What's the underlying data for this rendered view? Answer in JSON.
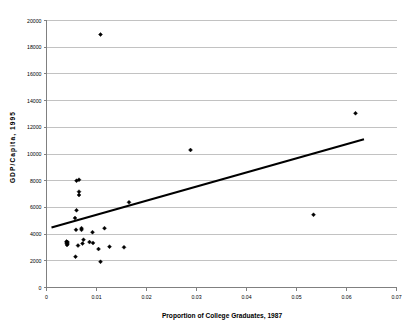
{
  "chart_data": {
    "type": "scatter",
    "title": "",
    "xlabel": "Proportion of College Graduates, 1987",
    "ylabel": "GDP/Capita, 1995",
    "xlim": [
      0,
      0.07
    ],
    "ylim": [
      0,
      20000
    ],
    "xticks": [
      0,
      0.01,
      0.02,
      0.03,
      0.04,
      0.05,
      0.06,
      0.07
    ],
    "xticklabels": [
      "0",
      "0.01",
      "0.02",
      "0.03",
      "0.04",
      "0.05",
      "0.06",
      "0.07"
    ],
    "yticks": [
      0,
      2000,
      4000,
      6000,
      8000,
      10000,
      12000,
      14000,
      16000,
      18000,
      20000
    ],
    "yticklabels": [
      "0",
      "2000",
      "4000",
      "6000",
      "8000",
      "10000",
      "12000",
      "14000",
      "16000",
      "18000",
      "20000"
    ],
    "grid": "horizontal",
    "legend": "none",
    "marker": "filled-diamond",
    "marker_color": "#000000",
    "points": [
      {
        "x": 0.0108,
        "y": 18950
      },
      {
        "x": 0.0618,
        "y": 13050
      },
      {
        "x": 0.0288,
        "y": 10300
      },
      {
        "x": 0.006,
        "y": 8000
      },
      {
        "x": 0.0065,
        "y": 8070
      },
      {
        "x": 0.0065,
        "y": 7180
      },
      {
        "x": 0.0065,
        "y": 6930
      },
      {
        "x": 0.0165,
        "y": 6380
      },
      {
        "x": 0.006,
        "y": 5780
      },
      {
        "x": 0.0534,
        "y": 5450
      },
      {
        "x": 0.0057,
        "y": 5200
      },
      {
        "x": 0.0116,
        "y": 4440
      },
      {
        "x": 0.007,
        "y": 4440
      },
      {
        "x": 0.007,
        "y": 4320
      },
      {
        "x": 0.0059,
        "y": 4320
      },
      {
        "x": 0.0092,
        "y": 4140
      },
      {
        "x": 0.0074,
        "y": 3580
      },
      {
        "x": 0.004,
        "y": 3450
      },
      {
        "x": 0.0042,
        "y": 3400
      },
      {
        "x": 0.004,
        "y": 3330
      },
      {
        "x": 0.0042,
        "y": 3260
      },
      {
        "x": 0.0041,
        "y": 3190
      },
      {
        "x": 0.0063,
        "y": 3140
      },
      {
        "x": 0.0086,
        "y": 3400
      },
      {
        "x": 0.0093,
        "y": 3340
      },
      {
        "x": 0.0072,
        "y": 3290
      },
      {
        "x": 0.0104,
        "y": 2880
      },
      {
        "x": 0.0126,
        "y": 3060
      },
      {
        "x": 0.0155,
        "y": 3010
      },
      {
        "x": 0.0058,
        "y": 2310
      },
      {
        "x": 0.0108,
        "y": 1930
      }
    ],
    "trend_line": {
      "x0": 0.001,
      "y0": 4500,
      "x1": 0.0635,
      "y1": 11100,
      "color": "#000000"
    }
  }
}
